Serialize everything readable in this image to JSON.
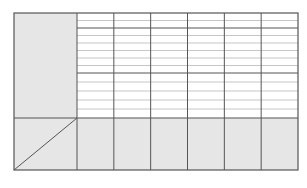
{
  "document": {
    "type": "blank printed table form",
    "header_text": "",
    "colors": {
      "paper": "#ffffff",
      "grid_line": "#555555",
      "thin_rule": "#b8b8b8",
      "shaded_cell": "#e6e6e6"
    },
    "table": {
      "data_columns": 6,
      "row_groups": [
        {
          "name": "header-band",
          "ruled_lines": 1
        },
        {
          "name": "group-1",
          "ruled_lines": 5
        },
        {
          "name": "group-2",
          "ruled_lines": 4
        }
      ],
      "label_column_shaded": true,
      "bottom_row_shaded": true,
      "corner_cell_diagonal": true,
      "cells": []
    }
  }
}
